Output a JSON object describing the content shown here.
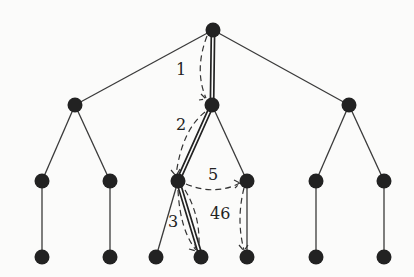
{
  "diagram": {
    "type": "tree-search-traversal",
    "colors": {
      "node": "#222222",
      "edge": "#3a3a3a",
      "background": "#fbfbfa"
    },
    "nodes": [
      {
        "id": "root",
        "x": 213,
        "y": 30
      },
      {
        "id": "L1a",
        "x": 75,
        "y": 105
      },
      {
        "id": "L1b",
        "x": 212,
        "y": 105
      },
      {
        "id": "L1c",
        "x": 349,
        "y": 105
      },
      {
        "id": "L2a",
        "x": 42,
        "y": 181
      },
      {
        "id": "L2b",
        "x": 110,
        "y": 181
      },
      {
        "id": "L2c",
        "x": 178,
        "y": 181
      },
      {
        "id": "L2d",
        "x": 247,
        "y": 181
      },
      {
        "id": "L2e",
        "x": 316,
        "y": 181
      },
      {
        "id": "L2f",
        "x": 384,
        "y": 181
      },
      {
        "id": "L3a",
        "x": 42,
        "y": 257
      },
      {
        "id": "L3b",
        "x": 110,
        "y": 257
      },
      {
        "id": "L3c",
        "x": 156,
        "y": 257
      },
      {
        "id": "L3d",
        "x": 201,
        "y": 257
      },
      {
        "id": "L3e",
        "x": 247,
        "y": 257
      },
      {
        "id": "L3f",
        "x": 316,
        "y": 257
      },
      {
        "id": "L3g",
        "x": 384,
        "y": 257
      }
    ],
    "highlighted_path": [
      "root",
      "L1b",
      "L2c",
      "L3d"
    ],
    "step_labels": [
      {
        "text": "1",
        "x": 176,
        "y": 62
      },
      {
        "text": "2",
        "x": 176,
        "y": 117
      },
      {
        "text": "3",
        "x": 168,
        "y": 214
      },
      {
        "text": "5",
        "x": 208,
        "y": 167
      },
      {
        "text": "46",
        "x": 210,
        "y": 206
      }
    ]
  }
}
